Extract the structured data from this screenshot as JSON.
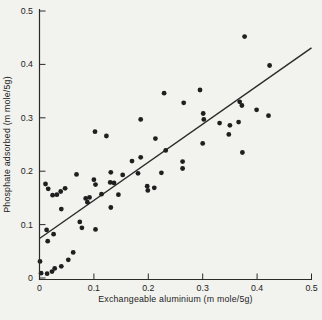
{
  "chart_data": {
    "type": "scatter",
    "title": "",
    "xlabel": "Exchangeable aluminium (m mole/5g)",
    "ylabel": "Phosphate adsorbed (m mole/5g)",
    "xlim": [
      0,
      0.5
    ],
    "ylim": [
      0,
      0.5
    ],
    "x_tick_values": [
      0,
      0.1,
      0.2,
      0.3,
      0.4,
      0.5
    ],
    "x_tick_labels": [
      "0",
      "0.1",
      "0.2",
      "0.3",
      "0.4",
      "0.5"
    ],
    "y_tick_values": [
      0,
      0.1,
      0.2,
      0.3,
      0.4,
      0.5
    ],
    "y_tick_labels": [
      "0",
      "0.1",
      "0.2",
      "0.3",
      "0.4",
      "0.5"
    ],
    "grid": false,
    "legend": null,
    "points": [
      [
        0.001,
        0.031
      ],
      [
        0.003,
        0.009
      ],
      [
        0.014,
        0.008
      ],
      [
        0.023,
        0.012
      ],
      [
        0.028,
        0.018
      ],
      [
        0.04,
        0.022
      ],
      [
        0.053,
        0.034
      ],
      [
        0.062,
        0.048
      ],
      [
        0.013,
        0.09
      ],
      [
        0.026,
        0.082
      ],
      [
        0.015,
        0.069
      ],
      [
        0.074,
        0.105
      ],
      [
        0.078,
        0.094
      ],
      [
        0.103,
        0.091
      ],
      [
        0.011,
        0.176
      ],
      [
        0.016,
        0.167
      ],
      [
        0.024,
        0.155
      ],
      [
        0.032,
        0.156
      ],
      [
        0.039,
        0.162
      ],
      [
        0.047,
        0.168
      ],
      [
        0.04,
        0.129
      ],
      [
        0.068,
        0.194
      ],
      [
        0.085,
        0.149
      ],
      [
        0.092,
        0.151
      ],
      [
        0.088,
        0.142
      ],
      [
        0.1,
        0.184
      ],
      [
        0.103,
        0.175
      ],
      [
        0.114,
        0.157
      ],
      [
        0.13,
        0.179
      ],
      [
        0.137,
        0.178
      ],
      [
        0.131,
        0.198
      ],
      [
        0.145,
        0.156
      ],
      [
        0.131,
        0.132
      ],
      [
        0.153,
        0.193
      ],
      [
        0.181,
        0.196
      ],
      [
        0.198,
        0.172
      ],
      [
        0.199,
        0.164
      ],
      [
        0.211,
        0.169
      ],
      [
        0.102,
        0.274
      ],
      [
        0.123,
        0.266
      ],
      [
        0.186,
        0.297
      ],
      [
        0.213,
        0.261
      ],
      [
        0.17,
        0.219
      ],
      [
        0.186,
        0.226
      ],
      [
        0.232,
        0.239
      ],
      [
        0.224,
        0.197
      ],
      [
        0.263,
        0.218
      ],
      [
        0.263,
        0.205
      ],
      [
        0.229,
        0.346
      ],
      [
        0.265,
        0.328
      ],
      [
        0.295,
        0.352
      ],
      [
        0.301,
        0.308
      ],
      [
        0.302,
        0.297
      ],
      [
        0.3,
        0.252
      ],
      [
        0.331,
        0.29
      ],
      [
        0.35,
        0.286
      ],
      [
        0.348,
        0.269
      ],
      [
        0.368,
        0.33
      ],
      [
        0.372,
        0.323
      ],
      [
        0.399,
        0.315
      ],
      [
        0.421,
        0.304
      ],
      [
        0.366,
        0.292
      ],
      [
        0.373,
        0.235
      ],
      [
        0.377,
        0.452
      ],
      [
        0.423,
        0.398
      ]
    ],
    "trend_line": {
      "x1": 0,
      "y1": 0.074,
      "x2": 0.5,
      "y2": 0.431
    },
    "point_color": "#1f1f1f",
    "line_color": "#2a2a2a",
    "axis_color": "#2a2a2a",
    "background_color": "#f2f2ee"
  }
}
